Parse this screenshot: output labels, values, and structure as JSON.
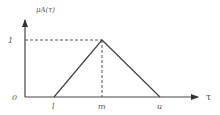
{
  "figure": {
    "type": "triangular-membership-function",
    "y_axis_label": "μA(τ)",
    "x_axis_label": "τ",
    "origin_label": "0",
    "peak_label": "1",
    "points": {
      "l": "l",
      "m": "m",
      "u": "u"
    }
  },
  "colors": {
    "line": "#444444",
    "text": "#555555",
    "background": "#ffffff"
  }
}
